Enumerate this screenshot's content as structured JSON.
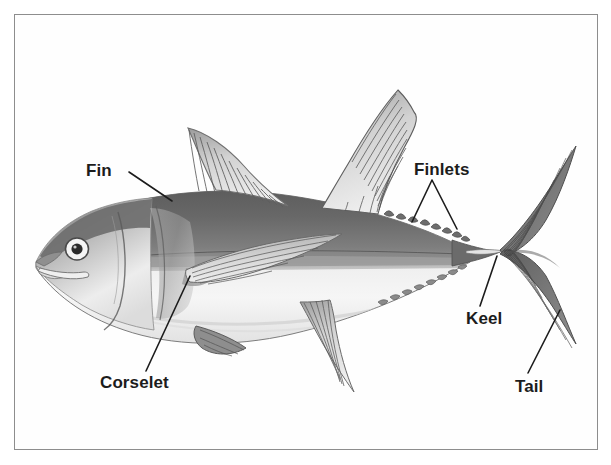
{
  "figure": {
    "type": "labelled-anatomy-diagram",
    "style": "grayscale pencil illustration inside thin rectangular border",
    "background_color": "#ffffff",
    "frame_color": "#8d8d8d",
    "ink_color": "#1c1c1c"
  },
  "labels": {
    "fin": "Fin",
    "corselet": "Corselet",
    "finlets": "Finlets",
    "keel": "Keel",
    "tail": "Tail"
  },
  "parts": [
    {
      "name": "fin",
      "label": "Fin",
      "points_to": "first dorsal fin"
    },
    {
      "name": "corselet",
      "label": "Corselet",
      "points_to": "thickened scaled shoulder band behind head"
    },
    {
      "name": "finlets",
      "label": "Finlets",
      "points_to": "row of small finlets on the dorsal edge"
    },
    {
      "name": "keel",
      "label": "Keel",
      "points_to": "lateral keel on caudal peduncle"
    },
    {
      "name": "tail",
      "label": "Tail",
      "points_to": "lunate caudal fin lower lobe"
    }
  ]
}
